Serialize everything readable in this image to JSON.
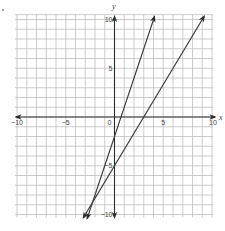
{
  "chart_data": {
    "type": "line",
    "title": "",
    "xlabel": "x",
    "ylabel": "y",
    "xlim": [
      -10,
      10
    ],
    "ylim": [
      -10,
      10
    ],
    "grid": true,
    "grid_step": 1,
    "x_tick_labels": [
      {
        "value": -10,
        "label": "−10"
      },
      {
        "value": -5,
        "label": "−5"
      },
      {
        "value": 0,
        "label": "0"
      },
      {
        "value": 5,
        "label": "5"
      },
      {
        "value": 10,
        "label": "10"
      }
    ],
    "y_tick_labels": [
      {
        "value": 10,
        "label": "10"
      },
      {
        "value": 5,
        "label": "5"
      },
      {
        "value": -5,
        "label": "−5"
      },
      {
        "value": -10,
        "label": "−10"
      }
    ],
    "series": [
      {
        "name": "line-1",
        "equation": "y = 3x - 2",
        "slope": 3,
        "intercept": -2,
        "x": [
          -2.8,
          4.1
        ],
        "y": [
          -10.4,
          10.3
        ],
        "arrows": "both",
        "color": "#3a3a3a"
      },
      {
        "name": "line-2",
        "equation": "y = (5/3)x - 5",
        "slope": 1.6667,
        "intercept": -5,
        "x": [
          -3.2,
          9.2
        ],
        "y": [
          -10.33,
          10.33
        ],
        "arrows": "both",
        "color": "#3a3a3a"
      }
    ],
    "legend": "none"
  },
  "colors": {
    "grid": "#b8b8b8",
    "axis": "#2a2a2a",
    "lines": "#3a3a3a"
  }
}
